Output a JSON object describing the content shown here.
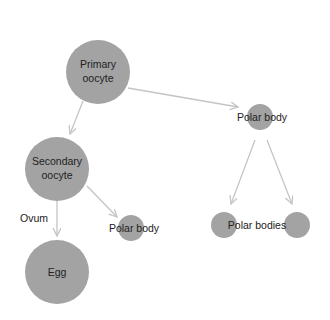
{
  "diagram": {
    "colors": {
      "node": "#a3a3a3",
      "edge": "#c4c4c4",
      "text": "#222222",
      "background": "#ffffff"
    },
    "nodes": [
      {
        "id": "primary",
        "label_lines": [
          "Primary",
          "oocyte"
        ],
        "cx": 98,
        "cy": 72,
        "r": 32
      },
      {
        "id": "secondary",
        "label_lines": [
          "Secondary",
          "oocyte"
        ],
        "cx": 57,
        "cy": 169,
        "r": 32
      },
      {
        "id": "egg",
        "label_lines": [
          "Egg"
        ],
        "cx": 57,
        "cy": 272,
        "r": 32
      },
      {
        "id": "polar1",
        "label_lines": [
          "Polar body"
        ],
        "cx": 131,
        "cy": 228,
        "r": 13
      },
      {
        "id": "polar_top",
        "label_lines": [
          "Polar body"
        ],
        "cx": 260,
        "cy": 117,
        "r": 13
      },
      {
        "id": "polar_b1",
        "label_lines": [
          ""
        ],
        "cx": 224,
        "cy": 225,
        "r": 13
      },
      {
        "id": "polar_b2",
        "label_lines": [
          ""
        ],
        "cx": 297,
        "cy": 225,
        "r": 13
      }
    ],
    "labels": {
      "primary_1": "Primary",
      "primary_2": "oocyte",
      "secondary_1": "Secondary",
      "secondary_2": "oocyte",
      "egg": "Egg",
      "ovum": "Ovum",
      "polar_body_left": "Polar body",
      "polar_body_top": "Polar body",
      "polar_bodies": "Polar bodies"
    },
    "edges": [
      {
        "from": "primary",
        "to": "secondary",
        "label": ""
      },
      {
        "from": "primary",
        "to": "polar_top",
        "label": ""
      },
      {
        "from": "secondary",
        "to": "egg",
        "label": "Ovum"
      },
      {
        "from": "secondary",
        "to": "polar1",
        "label": ""
      },
      {
        "from": "polar_top",
        "to": "polar_b1",
        "label": ""
      },
      {
        "from": "polar_top",
        "to": "polar_b2",
        "label": ""
      }
    ]
  }
}
